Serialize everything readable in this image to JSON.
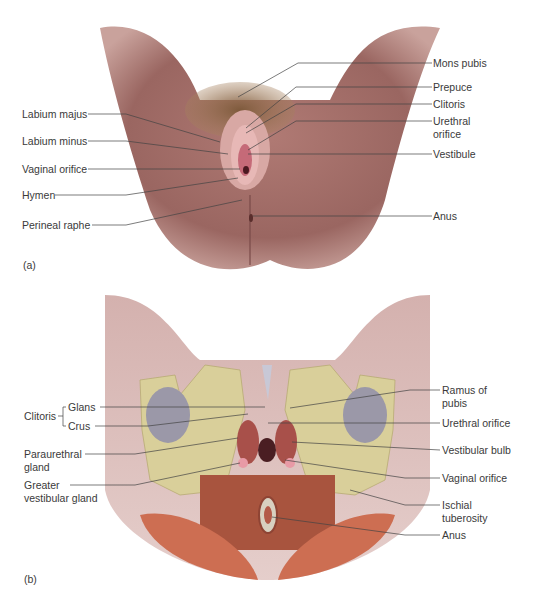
{
  "figure": {
    "panel_a": {
      "id_label": "(a)",
      "view": "external genitalia",
      "left_labels": [
        "Labium majus",
        "Labium minus",
        "Vaginal orifice",
        "Hymen",
        "Perineal raphe"
      ],
      "right_labels": [
        "Mons pubis",
        "Prepuce",
        "Clitoris",
        "Urethral\norifice",
        "Vestibule",
        "Anus"
      ]
    },
    "panel_b": {
      "id_label": "(b)",
      "view": "deep structures",
      "clitoris_group": {
        "label": "Clitoris",
        "parts": [
          "Glans",
          "Crus"
        ]
      },
      "left_labels": [
        "Paraurethral\ngland",
        "Greater\nvestibular gland"
      ],
      "right_labels": [
        "Ramus of\npubis",
        "Urethral orifice",
        "Vestibular bulb",
        "Vaginal orifice",
        "Ischial\ntuberosity",
        "Anus"
      ]
    },
    "colors": {
      "skin": "#b88580",
      "skin_dark": "#8e5b58",
      "hair": "#8a6a4a",
      "bone": "#d9cf9a",
      "muscle": "#c0604a",
      "foramen": "#9b98a8",
      "leader_line": "#444444",
      "leader_line_blue": "#4a4aa0"
    }
  }
}
